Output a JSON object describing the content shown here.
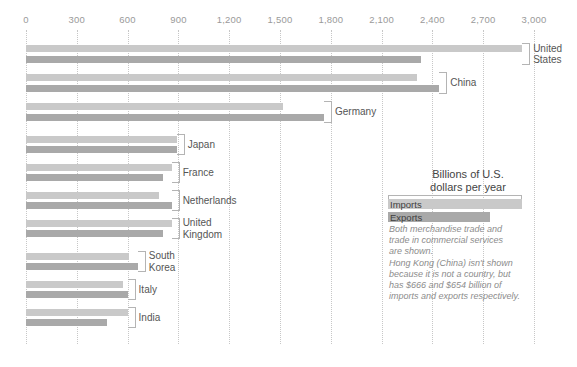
{
  "chart_data": {
    "type": "bar",
    "title": "",
    "subtitle": "",
    "xlabel": "Billions of U.S. dollars per year",
    "ylabel": "",
    "xlim": [
      0,
      3000
    ],
    "xticks": [
      0,
      300,
      600,
      900,
      1200,
      1500,
      1800,
      2100,
      2400,
      2700,
      3000
    ],
    "xticklabels": [
      "0",
      "300",
      "600",
      "900",
      "1,200",
      "1,500",
      "1,800",
      "2,100",
      "2,400",
      "2,700",
      "3,000"
    ],
    "grid": true,
    "legend_position": "right",
    "orientation": "horizontal",
    "categories": [
      "United States",
      "China",
      "Germany",
      "Japan",
      "France",
      "Netherlands",
      "United Kingdom",
      "South Korea",
      "Italy",
      "India"
    ],
    "series": [
      {
        "name": "Imports",
        "color": "#c9c9c9",
        "values": [
          2930,
          2310,
          1520,
          890,
          860,
          785,
          860,
          610,
          570,
          600
        ]
      },
      {
        "name": "Exports",
        "color": "#a9a9a9",
        "values": [
          2330,
          2440,
          1760,
          890,
          810,
          860,
          810,
          660,
          600,
          480
        ]
      }
    ],
    "annotations": [
      "Both merchandise trade and trade in commercial services are shown.",
      "Hong Kong (China) isn't shown because it is not a country, but has $666 and $654 billion of imports and exports respectively."
    ]
  },
  "axis": {
    "ticks": [
      {
        "label": "0",
        "value": 0
      },
      {
        "label": "300",
        "value": 300
      },
      {
        "label": "600",
        "value": 600
      },
      {
        "label": "900",
        "value": 900
      },
      {
        "label": "1,200",
        "value": 1200
      },
      {
        "label": "1,500",
        "value": 1500
      },
      {
        "label": "1,800",
        "value": 1800
      },
      {
        "label": "2,100",
        "value": 2100
      },
      {
        "label": "2,400",
        "value": 2400
      },
      {
        "label": "2,700",
        "value": 2700
      },
      {
        "label": "3,000",
        "value": 3000
      }
    ]
  },
  "countries": [
    {
      "name": "United States",
      "label": "United\nStates",
      "imports": 2930,
      "exports": 2330
    },
    {
      "name": "China",
      "label": "China",
      "imports": 2310,
      "exports": 2440
    },
    {
      "name": "Germany",
      "label": "Germany",
      "imports": 1520,
      "exports": 1760
    },
    {
      "name": "Japan",
      "label": "Japan",
      "imports": 890,
      "exports": 890
    },
    {
      "name": "France",
      "label": "France",
      "imports": 860,
      "exports": 810
    },
    {
      "name": "Netherlands",
      "label": "Netherlands",
      "imports": 785,
      "exports": 860
    },
    {
      "name": "United Kingdom",
      "label": "United\nKingdom",
      "imports": 860,
      "exports": 810
    },
    {
      "name": "South Korea",
      "label": "South\nKorea",
      "imports": 610,
      "exports": 660
    },
    {
      "name": "Italy",
      "label": "Italy",
      "imports": 570,
      "exports": 600
    },
    {
      "name": "India",
      "label": "India",
      "imports": 600,
      "exports": 480
    }
  ],
  "legend": {
    "title": "Billions of U.S.\ndollars per year",
    "imports_label": "Imports",
    "exports_label": "Exports",
    "note_1": "Both merchandise trade and\ntrade in commercial services\nare shown.",
    "note_2": "Hong Kong (China) isn't shown\nbecause it is not a country, but\nhas $666 and $654 billion of\nimports and exports respectively.",
    "imports_color": "#c9c9c9",
    "exports_color": "#a9a9a9"
  }
}
